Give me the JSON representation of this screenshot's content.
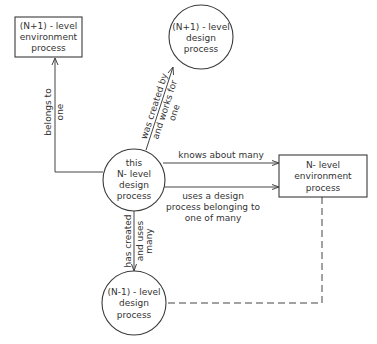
{
  "diagram": {
    "nodes": [
      {
        "id": "n_plus_1_env",
        "shape": "rectangle",
        "lines": [
          "(N+1) - level",
          "environment",
          "process"
        ]
      },
      {
        "id": "n_plus_1_design",
        "shape": "circle",
        "lines": [
          "(N+1) - level",
          "design",
          "process"
        ]
      },
      {
        "id": "this_n_design",
        "shape": "circle",
        "lines": [
          "this",
          "N- level",
          "design",
          "process"
        ]
      },
      {
        "id": "n_env",
        "shape": "rectangle",
        "lines": [
          "N- level",
          "environment",
          "process"
        ]
      },
      {
        "id": "n_minus_1_design",
        "shape": "circle",
        "lines": [
          "(N-1) - level",
          "design",
          "process"
        ]
      }
    ],
    "edges": [
      {
        "id": "belongs",
        "from": "this_n_design",
        "to": "n_plus_1_env",
        "style": "solid",
        "arrow": true,
        "label_lines": [
          "belongs to",
          "one"
        ]
      },
      {
        "id": "created_by",
        "from": "this_n_design",
        "to": "n_plus_1_design",
        "style": "solid",
        "arrow": true,
        "label_lines": [
          "was created by",
          "and works for",
          "one"
        ]
      },
      {
        "id": "knows",
        "from": "this_n_design",
        "to": "n_env",
        "style": "solid",
        "arrow": true,
        "label_lines": [
          "knows about many"
        ]
      },
      {
        "id": "uses",
        "from": "this_n_design",
        "to": "n_env",
        "style": "solid",
        "arrow": true,
        "label_lines": [
          "uses a design",
          "process belonging to",
          "one of many"
        ]
      },
      {
        "id": "has_created",
        "from": "this_n_design",
        "to": "n_minus_1_design",
        "style": "solid",
        "arrow": true,
        "label_lines": [
          "has created",
          "and uses",
          "many"
        ]
      },
      {
        "id": "dashed_link",
        "from": "n_env",
        "to": "n_minus_1_design",
        "style": "dashed",
        "arrow": false,
        "label_lines": []
      }
    ]
  }
}
